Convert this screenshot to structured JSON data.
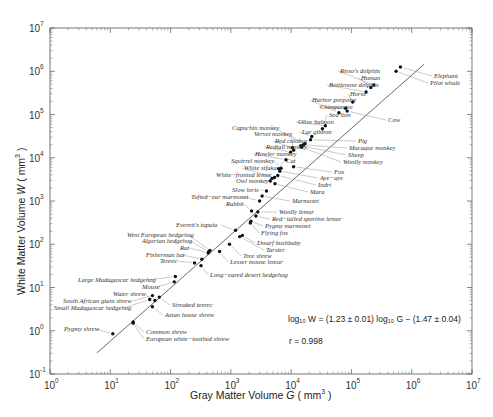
{
  "chart_data": {
    "type": "scatter",
    "title": "",
    "xlabel": "Gray Matter Volume G ( mm^3 )",
    "ylabel": "White Matter Volume W ( mm^3 )",
    "xscale": "log",
    "yscale": "log",
    "xlim": [
      1,
      10000000
    ],
    "ylim": [
      0.1,
      10000000
    ],
    "x_ticks": [
      "10^0",
      "10^1",
      "10^2",
      "10^3",
      "10^4",
      "10^5",
      "10^6",
      "10^7"
    ],
    "y_ticks": [
      "10^-1",
      "10^0",
      "10^1",
      "10^2",
      "10^3",
      "10^4",
      "10^5",
      "10^6",
      "10^7"
    ],
    "grid": false,
    "legend": null,
    "fit": {
      "equation": "log10 W = (1.23 ± 0.01) log10 G − (1.47 ± 0.04)",
      "slope": 1.23,
      "slope_err": 0.01,
      "intercept": -1.47,
      "intercept_err": 0.04,
      "r": 0.998
    },
    "points": [
      {
        "name": "Pygmy shrew",
        "G": 11,
        "W": 0.85
      },
      {
        "name": "Common shrew",
        "G": 24,
        "W": 1.6
      },
      {
        "name": "European white-toothed shrew",
        "G": 24,
        "W": 1.5
      },
      {
        "name": "Asian house shrew",
        "G": 50,
        "W": 3.6
      },
      {
        "name": "Streaked tenrec",
        "G": 65,
        "W": 6
      },
      {
        "name": "Small Madagascar hedgehog",
        "G": 45,
        "W": 5.3
      },
      {
        "name": "South African giant shrew",
        "G": 50,
        "W": 6.5
      },
      {
        "name": "Water shrew",
        "G": 55,
        "W": 5
      },
      {
        "name": "Mouse",
        "G": 115,
        "W": 13.5
      },
      {
        "name": "Large Madagascar hedgehog",
        "G": 120,
        "W": 18
      },
      {
        "name": "Long-eared desert hedgehog",
        "G": 320,
        "W": 32
      },
      {
        "name": "Tenrec",
        "G": 250,
        "W": 37
      },
      {
        "name": "Fisherman bat",
        "G": 330,
        "W": 45
      },
      {
        "name": "Rat",
        "G": 420,
        "W": 63
      },
      {
        "name": "Algerian hedgehog",
        "G": 430,
        "W": 68
      },
      {
        "name": "West European hedgehog",
        "G": 450,
        "W": 72
      },
      {
        "name": "Lesser mouse lemur",
        "G": 650,
        "W": 68
      },
      {
        "name": "Tree shrew",
        "G": 950,
        "W": 100
      },
      {
        "name": "Tarsier",
        "G": 1400,
        "W": 150
      },
      {
        "name": "Dwarf bushbaby",
        "G": 1550,
        "W": 160
      },
      {
        "name": "Everett's tupaia",
        "G": 1200,
        "W": 210
      },
      {
        "name": "Flying fox",
        "G": 2100,
        "W": 310
      },
      {
        "name": "Pygmy marmoset",
        "G": 2150,
        "W": 340
      },
      {
        "name": "Red-tailed sportive lemur",
        "G": 2600,
        "W": 450
      },
      {
        "name": "Woolly lemur",
        "G": 2800,
        "W": 560
      },
      {
        "name": "Rabbit",
        "G": 2200,
        "W": 590
      },
      {
        "name": "Tufted-ear marmoset",
        "G": 3000,
        "W": 1000
      },
      {
        "name": "Marmoset",
        "G": 3300,
        "W": 1300
      },
      {
        "name": "Slow loris",
        "G": 3900,
        "W": 1700
      },
      {
        "name": "Mara",
        "G": 5400,
        "W": 2500
      },
      {
        "name": "Owl monkey",
        "G": 4500,
        "W": 2900
      },
      {
        "name": "White-fronted lemur",
        "G": 4800,
        "W": 3300
      },
      {
        "name": "White sifaka",
        "G": 5300,
        "W": 3500
      },
      {
        "name": "Indri",
        "G": 6000,
        "W": 3900
      },
      {
        "name": "Aye-aye",
        "G": 6500,
        "W": 4900
      },
      {
        "name": "Cat",
        "G": 6200,
        "W": 5600
      },
      {
        "name": "Squirrel monkey",
        "G": 6800,
        "W": 5700
      },
      {
        "name": "Fox",
        "G": 11000,
        "W": 6200
      },
      {
        "name": "Howler monkey",
        "G": 8200,
        "W": 9000
      },
      {
        "name": "Redtail monkey",
        "G": 9800,
        "W": 13500
      },
      {
        "name": "Vervet monkey",
        "G": 11000,
        "W": 15000
      },
      {
        "name": "Red colobus",
        "G": 10500,
        "W": 17000
      },
      {
        "name": "Woolly monkey",
        "G": 15000,
        "W": 17500
      },
      {
        "name": "Sheep",
        "G": 14500,
        "W": 19000
      },
      {
        "name": "Macaque monkey",
        "G": 16000,
        "W": 20000
      },
      {
        "name": "Capuchin monkey",
        "G": 17000,
        "W": 21000
      },
      {
        "name": "Pig",
        "G": 21000,
        "W": 26000
      },
      {
        "name": "Lar gibbon",
        "G": 22000,
        "W": 31000
      },
      {
        "name": "Olive baboon",
        "G": 37000,
        "W": 55000
      },
      {
        "name": "Sea lion",
        "G": 33000,
        "W": 47000
      },
      {
        "name": "Cow",
        "G": 85000,
        "W": 120000
      },
      {
        "name": "Chimpanzee",
        "G": 80000,
        "W": 140000
      },
      {
        "name": "Harbor porpoise",
        "G": 62000,
        "W": 110000
      },
      {
        "name": "Horse",
        "G": 105000,
        "W": 195000
      },
      {
        "name": "Bottlenose dolphin",
        "G": 175000,
        "W": 330000
      },
      {
        "name": "Human",
        "G": 210000,
        "W": 420000
      },
      {
        "name": "Risso's dolphin",
        "G": 235000,
        "W": 480000
      },
      {
        "name": "Pilot whale",
        "G": 550000,
        "W": 1000000
      },
      {
        "name": "Elephant",
        "G": 650000,
        "W": 1250000
      }
    ]
  },
  "labels": {
    "x_title_pre": "Gray Matter Volume ",
    "x_title_var": "G",
    "x_title_post": " ( mm",
    "x_title_sup": "3",
    "x_title_close": " )",
    "y_title_pre": "White Matter Volume ",
    "y_title_var": "W",
    "y_title_post": " ( mm",
    "y_title_sup": "3",
    "y_title_close": " )",
    "eq_line": "log₁₀ W = (1.23 ± 0.01) log₁₀ G − (1.47 ± 0.04)",
    "r_line": "r = 0.998"
  },
  "animal_labels": [
    {
      "text": "Risso's dolphin",
      "x": 340,
      "y": 73,
      "anchor": "start"
    },
    {
      "text": "Human",
      "x": 361,
      "y": 80,
      "anchor": "start"
    },
    {
      "text": "Bottlenose dolphin",
      "x": 329,
      "y": 87,
      "anchor": "start"
    },
    {
      "text": "Elephant",
      "x": 434,
      "y": 78,
      "anchor": "start"
    },
    {
      "text": "Pilot whale",
      "x": 430,
      "y": 85,
      "anchor": "start"
    },
    {
      "text": "Horse",
      "x": 350,
      "y": 96,
      "anchor": "start"
    },
    {
      "text": "Harbor porpoise",
      "x": 312,
      "y": 102,
      "anchor": "start"
    },
    {
      "text": "Chimpanzee",
      "x": 320,
      "y": 109,
      "anchor": "start"
    },
    {
      "text": "Sea lion",
      "x": 329,
      "y": 117,
      "anchor": "start"
    },
    {
      "text": "Olive baboon",
      "x": 298,
      "y": 124,
      "anchor": "start"
    },
    {
      "text": "Cow",
      "x": 388,
      "y": 122,
      "anchor": "start"
    },
    {
      "text": "Capuchin monkey",
      "x": 232,
      "y": 130,
      "anchor": "start"
    },
    {
      "text": "Vervet monkey",
      "x": 254,
      "y": 136,
      "anchor": "start"
    },
    {
      "text": "Lar gibbon",
      "x": 302,
      "y": 134,
      "anchor": "start"
    },
    {
      "text": "Red colobus",
      "x": 275,
      "y": 143,
      "anchor": "start"
    },
    {
      "text": "Redtail monkey",
      "x": 266,
      "y": 149,
      "anchor": "start"
    },
    {
      "text": "Pig",
      "x": 358,
      "y": 143,
      "anchor": "start"
    },
    {
      "text": "Macaque monkey",
      "x": 349,
      "y": 150,
      "anchor": "start"
    },
    {
      "text": "Howler monkey",
      "x": 255,
      "y": 156,
      "anchor": "start"
    },
    {
      "text": "Sheep",
      "x": 348,
      "y": 157,
      "anchor": "start"
    },
    {
      "text": "Woolly monkey",
      "x": 343,
      "y": 164,
      "anchor": "start"
    },
    {
      "text": "Squirrel monkey",
      "x": 231,
      "y": 163,
      "anchor": "start"
    },
    {
      "text": "Cat",
      "x": 286,
      "y": 163,
      "anchor": "start"
    },
    {
      "text": "White sifaka",
      "x": 244,
      "y": 170,
      "anchor": "start"
    },
    {
      "text": "White-fronted lemur",
      "x": 216,
      "y": 177,
      "anchor": "start"
    },
    {
      "text": "Owl monkey",
      "x": 236,
      "y": 183,
      "anchor": "start"
    },
    {
      "text": "Fox",
      "x": 334,
      "y": 174,
      "anchor": "start"
    },
    {
      "text": "Aye-aye",
      "x": 320,
      "y": 180,
      "anchor": "start"
    },
    {
      "text": "Indri",
      "x": 318,
      "y": 187,
      "anchor": "start"
    },
    {
      "text": "Mara",
      "x": 310,
      "y": 194,
      "anchor": "start"
    },
    {
      "text": "Slow loris",
      "x": 232,
      "y": 192,
      "anchor": "start"
    },
    {
      "text": "Marmoset",
      "x": 292,
      "y": 203,
      "anchor": "start"
    },
    {
      "text": "Tufted-ear marmoset",
      "x": 191,
      "y": 199,
      "anchor": "start"
    },
    {
      "text": "Rabbit",
      "x": 226,
      "y": 206,
      "anchor": "start"
    },
    {
      "text": "Woolly lemur",
      "x": 279,
      "y": 214,
      "anchor": "start"
    },
    {
      "text": "Red-tailed sportive lemur",
      "x": 272,
      "y": 221,
      "anchor": "start"
    },
    {
      "text": "Pygmy marmoset",
      "x": 265,
      "y": 228,
      "anchor": "start"
    },
    {
      "text": "Everett's tupaia",
      "x": 176,
      "y": 227,
      "anchor": "start"
    },
    {
      "text": "Flying fox",
      "x": 261,
      "y": 235,
      "anchor": "start"
    },
    {
      "text": "West European hedgehog",
      "x": 127,
      "y": 237,
      "anchor": "start"
    },
    {
      "text": "Algerian hedgehog",
      "x": 142,
      "y": 243,
      "anchor": "start"
    },
    {
      "text": "Dwarf bushbaby",
      "x": 257,
      "y": 245,
      "anchor": "start"
    },
    {
      "text": "Rat",
      "x": 180,
      "y": 250,
      "anchor": "start"
    },
    {
      "text": "Tarsier",
      "x": 266,
      "y": 252,
      "anchor": "start"
    },
    {
      "text": "Fisherman bat",
      "x": 146,
      "y": 257,
      "anchor": "start"
    },
    {
      "text": "Tree shrew",
      "x": 243,
      "y": 258,
      "anchor": "start"
    },
    {
      "text": "Tenrec",
      "x": 160,
      "y": 263,
      "anchor": "start"
    },
    {
      "text": "Lesser mouse lemur",
      "x": 230,
      "y": 264,
      "anchor": "start"
    },
    {
      "text": "Large Madagascar hedgehog",
      "x": 78,
      "y": 282,
      "anchor": "start"
    },
    {
      "text": "Long-eared desert hedgehog",
      "x": 210,
      "y": 277,
      "anchor": "start"
    },
    {
      "text": "Mouse",
      "x": 142,
      "y": 289,
      "anchor": "start"
    },
    {
      "text": "Water shrew",
      "x": 113,
      "y": 296,
      "anchor": "start"
    },
    {
      "text": "South African giant shrew",
      "x": 63,
      "y": 303,
      "anchor": "start"
    },
    {
      "text": "Small Madagascar hedgehog",
      "x": 54,
      "y": 310,
      "anchor": "start"
    },
    {
      "text": "Streaked tenrec",
      "x": 172,
      "y": 307,
      "anchor": "start"
    },
    {
      "text": "Asian house shrew",
      "x": 165,
      "y": 317,
      "anchor": "start"
    },
    {
      "text": "Pygmy shrew",
      "x": 64,
      "y": 331,
      "anchor": "start"
    },
    {
      "text": "Common shrew",
      "x": 146,
      "y": 334,
      "anchor": "start"
    },
    {
      "text": "European white-toothed shrew",
      "x": 146,
      "y": 341,
      "anchor": "start"
    }
  ]
}
